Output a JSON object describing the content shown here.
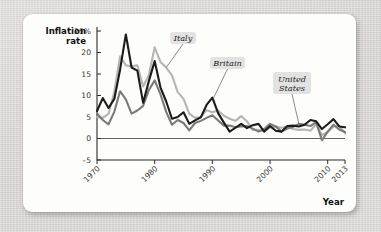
{
  "chart_data": {
    "type": "line",
    "title": "",
    "xlabel": "Year",
    "ylabel": "Inflation rate",
    "xlim": [
      1970,
      2013
    ],
    "ylim": [
      -5,
      25
    ],
    "grid": false,
    "legend_position": "inline-callouts",
    "y_ticks": [
      "25%",
      "20",
      "15",
      "10",
      "5",
      "0",
      "–5"
    ],
    "y_tick_values": [
      25,
      20,
      15,
      10,
      5,
      0,
      -5
    ],
    "x_ticks": [
      "1970",
      "1980",
      "1990",
      "2000",
      "2010",
      "2013"
    ],
    "x_tick_values": [
      1970,
      1980,
      1990,
      2000,
      2010,
      2013
    ],
    "x": [
      1970,
      1971,
      1972,
      1973,
      1974,
      1975,
      1976,
      1977,
      1978,
      1979,
      1980,
      1981,
      1982,
      1983,
      1984,
      1985,
      1986,
      1987,
      1988,
      1989,
      1990,
      1991,
      1992,
      1993,
      1994,
      1995,
      1996,
      1997,
      1998,
      1999,
      2000,
      2001,
      2002,
      2003,
      2004,
      2005,
      2006,
      2007,
      2008,
      2009,
      2010,
      2011,
      2012,
      2013
    ],
    "series": [
      {
        "name": "Britain",
        "color": "#1b1b1b",
        "width": 2.1,
        "values": [
          6.4,
          9.4,
          7.1,
          9.2,
          16.0,
          24.2,
          16.5,
          15.8,
          8.3,
          13.4,
          18.0,
          11.9,
          8.6,
          4.6,
          5.0,
          6.1,
          3.4,
          4.2,
          4.9,
          7.8,
          9.5,
          5.9,
          3.7,
          1.6,
          2.5,
          3.4,
          2.4,
          3.1,
          3.4,
          1.6,
          2.9,
          1.8,
          1.6,
          2.9,
          3.0,
          2.8,
          3.2,
          4.3,
          4.0,
          2.2,
          3.3,
          4.5,
          2.8,
          2.6
        ]
      },
      {
        "name": "Italy",
        "color": "#b5b5b5",
        "width": 2.1,
        "values": [
          5.0,
          4.8,
          5.7,
          10.8,
          19.1,
          17.0,
          16.8,
          17.0,
          12.1,
          14.8,
          21.2,
          17.8,
          16.5,
          14.7,
          10.8,
          9.2,
          5.8,
          4.8,
          5.0,
          6.6,
          6.1,
          6.5,
          5.3,
          4.6,
          4.1,
          5.2,
          4.0,
          2.0,
          2.0,
          1.7,
          2.5,
          2.8,
          2.5,
          2.7,
          2.2,
          2.0,
          2.1,
          1.8,
          3.3,
          0.8,
          1.5,
          2.8,
          3.0,
          1.2
        ]
      },
      {
        "name": "United States",
        "color": "#7a7a7a",
        "width": 2.1,
        "values": [
          5.8,
          4.3,
          3.3,
          6.2,
          11.0,
          9.1,
          5.8,
          6.5,
          7.6,
          11.3,
          13.5,
          10.3,
          6.2,
          3.2,
          4.3,
          3.6,
          1.9,
          3.6,
          4.1,
          4.8,
          5.4,
          4.2,
          3.0,
          3.0,
          2.6,
          2.8,
          2.9,
          2.3,
          1.6,
          2.2,
          3.4,
          2.8,
          1.6,
          2.3,
          2.7,
          3.4,
          3.2,
          2.9,
          3.8,
          -0.4,
          1.6,
          3.2,
          2.1,
          1.5
        ]
      }
    ],
    "annotations": [
      {
        "label": "Italy",
        "target_x": 1982.0,
        "target_y": 16.5
      },
      {
        "label": "Britain",
        "target_x": 1990.2,
        "target_y": 9.4
      },
      {
        "label": "United States",
        "lines": [
          "United",
          "States"
        ],
        "target_x": 2005.0,
        "target_y": 3.4
      }
    ]
  },
  "figure": {
    "background_color": "#fdfdfc",
    "page_color": "#dedbd8",
    "callout_bg": "#e2e2e2"
  }
}
